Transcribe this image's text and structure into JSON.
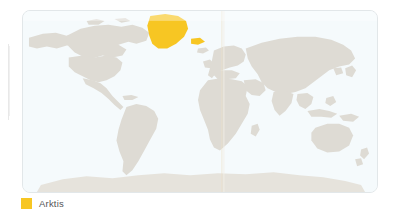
{
  "figure": {
    "type": "world-map",
    "panel": {
      "background_color": "#f5fafc",
      "border_color": "#e2e7e9",
      "corner_radius_px": 8
    }
  },
  "map": {
    "projection_note": "world map, whole globe",
    "land_color": "#dedbd4",
    "ocean_color": "#f5fafc",
    "highlight_color": "#f7c623",
    "highlighted_regions": [
      {
        "name": "Arktis",
        "represented_by": "Greenland",
        "color": "#f7c623"
      }
    ],
    "landmasses": [
      "North America",
      "South America",
      "Greenland",
      "Europe",
      "Africa",
      "Asia",
      "Australia",
      "Antarctica"
    ]
  },
  "legend": {
    "position": "below-map-left",
    "entries": [
      {
        "label": "Arktis",
        "color": "#f7c623"
      }
    ]
  },
  "artifacts": {
    "page_fold_line": "faint vertical crease near map center",
    "page_edge_line": "faint vertical line at left page margin"
  }
}
